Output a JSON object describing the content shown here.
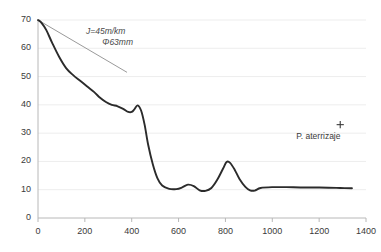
{
  "chart_data": {
    "type": "line",
    "title": "",
    "xlabel": "",
    "ylabel": "",
    "xlim": [
      0,
      1400
    ],
    "ylim": [
      0,
      70
    ],
    "grid": true,
    "grid_axis": "y",
    "legend": "none",
    "x_ticks": [
      0,
      200,
      400,
      600,
      800,
      1000,
      1200,
      1400
    ],
    "y_ticks": [
      0,
      10,
      20,
      30,
      40,
      50,
      60,
      70
    ],
    "series": [
      {
        "name": "profile",
        "color": "#2b2b2b",
        "x": [
          0,
          15,
          35,
          60,
          90,
          120,
          150,
          180,
          210,
          240,
          265,
          290,
          315,
          340,
          365,
          385,
          400,
          412,
          425,
          440,
          455,
          470,
          490,
          510,
          530,
          560,
          590,
          615,
          640,
          665,
          690,
          715,
          740,
          765,
          790,
          805,
          820,
          840,
          860,
          885,
          905,
          925,
          950,
          1000,
          1060,
          1120,
          1180,
          1240,
          1290,
          1340
        ],
        "y": [
          70,
          69,
          66.5,
          62,
          57,
          53,
          50.5,
          48.5,
          46.5,
          44.5,
          42.5,
          41,
          40,
          39.5,
          38.5,
          37.5,
          37.5,
          38.5,
          39.8,
          38,
          33,
          26,
          19,
          14,
          11.5,
          10.3,
          10.2,
          10.8,
          11.8,
          11.3,
          9.8,
          9.6,
          10.6,
          13.5,
          17.5,
          19.8,
          19.5,
          17,
          13.8,
          11,
          9.8,
          9.7,
          10.6,
          10.9,
          10.9,
          10.8,
          10.8,
          10.7,
          10.6,
          10.5
        ]
      }
    ],
    "reference_line": {
      "name": "gradient-reference",
      "color": "#9a9a9a",
      "x": [
        0,
        380
      ],
      "y": [
        70,
        51.5
      ],
      "label_line1": "J=45m/km",
      "label_line2": "Φ63mm"
    },
    "point_markers": [
      {
        "name": "landing-point",
        "label": "P. aterrizaje",
        "marker": "+",
        "x": 1290,
        "y": 33,
        "color": "#3a3a3a"
      }
    ],
    "axis_color": "#b8b8b8",
    "grid_color": "#ededed",
    "background": "#ffffff"
  }
}
